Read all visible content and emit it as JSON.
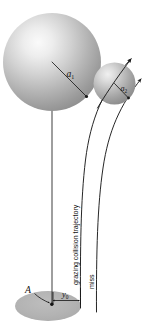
{
  "figure": {
    "background_color": "#ffffff",
    "line_color": "#1a1a1a",
    "sphere_edge_color": "#8d8d8d",
    "sphere_light_color": "#f2f2f2",
    "sphere_mid_color": "#b9b9b9",
    "sphere_dark_color": "#7c7c7c",
    "ground_color": "#b0b0b0"
  },
  "labels": {
    "radius_large": "a",
    "radius_large_sub": "1",
    "radius_small": "a",
    "radius_small_sub": "2",
    "impact_parameter": "y",
    "impact_parameter_sub": "0",
    "point_a": "A",
    "trajectory_grazing": "grazing collision trajectory",
    "trajectory_miss": "miss"
  },
  "elements": {
    "large_sphere": {
      "cx": 52,
      "cy": 62,
      "r": 49
    },
    "small_sphere": {
      "cx": 114.5,
      "cy": 83.5,
      "r": 21
    },
    "ground_ellipse": {
      "cx": 48,
      "cy": 306,
      "rx": 33,
      "ry": 15
    },
    "vertical_axis": {
      "x": 52,
      "y_top": 62,
      "y_bottom": 305
    },
    "dimension_span": {
      "x_start": 52,
      "x_end": 80,
      "y": 300
    }
  }
}
